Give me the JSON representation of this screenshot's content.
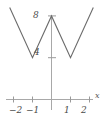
{
  "figure": {
    "name": "triangle-wave-plot",
    "background_color": "#ffffff",
    "line_color": "#6b6b6b",
    "axis_color": "#9a9a9a",
    "label_color": "#4a4a4a"
  },
  "axis": {
    "x_name": "x",
    "y_name": ""
  },
  "labels": {
    "y_8": "8",
    "y_4": "4",
    "x_m2": "−2",
    "x_m1": "−1",
    "x_p1": "1",
    "x_p2": "2"
  },
  "chart_data": {
    "type": "line",
    "title": "",
    "subtitle": "",
    "xlabel": "x",
    "ylabel": "",
    "xlim": [
      -2.45,
      2.45
    ],
    "ylim": [
      0,
      9.2
    ],
    "xticks": [
      -2,
      -1,
      0,
      1,
      2
    ],
    "xticklabels": [
      "−2",
      "−1",
      "",
      "1",
      "2"
    ],
    "yticks": [
      4,
      8
    ],
    "yticklabels": [
      "4",
      "8"
    ],
    "grid": false,
    "legend": null,
    "series": [
      {
        "name": "triangle-wave",
        "x": [
          -2.2,
          -1,
          0,
          1,
          2.2
        ],
        "y": [
          8.8,
          4,
          8,
          4,
          8.8
        ]
      }
    ],
    "annotations": []
  }
}
